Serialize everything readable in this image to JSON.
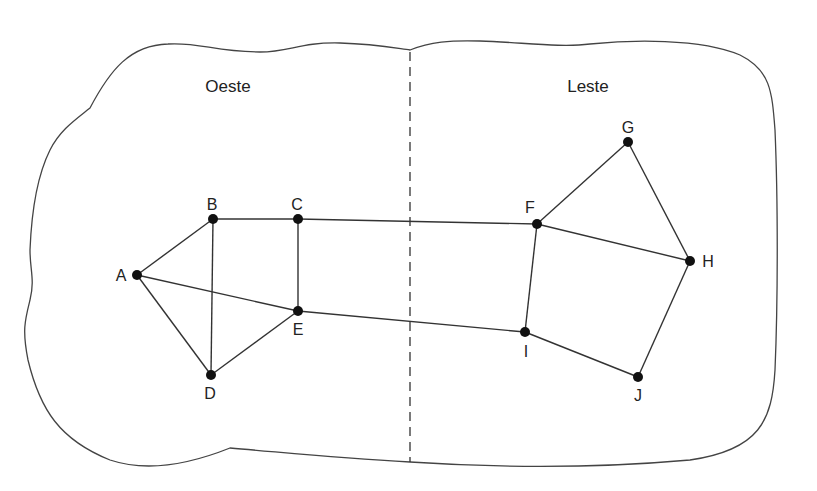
{
  "diagram": {
    "type": "graph",
    "regions": [
      {
        "id": "west",
        "label": "Oeste",
        "x": 228,
        "y": 92
      },
      {
        "id": "east",
        "label": "Leste",
        "x": 588,
        "y": 92
      }
    ],
    "divider": {
      "x": 410,
      "y1": 52,
      "y2": 462,
      "style": "dashed"
    },
    "nodes": [
      {
        "id": "A",
        "label": "A",
        "x": 137,
        "y": 275,
        "lx": 121,
        "ly": 281
      },
      {
        "id": "B",
        "label": "B",
        "x": 213,
        "y": 219,
        "lx": 212,
        "ly": 210
      },
      {
        "id": "C",
        "label": "C",
        "x": 298,
        "y": 219,
        "lx": 297,
        "ly": 210
      },
      {
        "id": "D",
        "label": "D",
        "x": 211,
        "y": 375,
        "lx": 210,
        "ly": 399
      },
      {
        "id": "E",
        "label": "E",
        "x": 298,
        "y": 311,
        "lx": 298,
        "ly": 335
      },
      {
        "id": "F",
        "label": "F",
        "x": 537,
        "y": 224,
        "lx": 530,
        "ly": 213
      },
      {
        "id": "G",
        "label": "G",
        "x": 628,
        "y": 142,
        "lx": 628,
        "ly": 133
      },
      {
        "id": "H",
        "label": "H",
        "x": 690,
        "y": 261,
        "lx": 708,
        "ly": 267
      },
      {
        "id": "I",
        "label": "I",
        "x": 525,
        "y": 332,
        "lx": 526,
        "ly": 357
      },
      {
        "id": "J",
        "label": "J",
        "x": 638,
        "y": 377,
        "lx": 638,
        "ly": 401
      }
    ],
    "edges": [
      [
        "A",
        "B"
      ],
      [
        "A",
        "D"
      ],
      [
        "A",
        "E"
      ],
      [
        "B",
        "C"
      ],
      [
        "B",
        "D"
      ],
      [
        "C",
        "E"
      ],
      [
        "D",
        "E"
      ],
      [
        "C",
        "F"
      ],
      [
        "E",
        "I"
      ],
      [
        "F",
        "G"
      ],
      [
        "F",
        "H"
      ],
      [
        "F",
        "I"
      ],
      [
        "G",
        "H"
      ],
      [
        "H",
        "J"
      ],
      [
        "I",
        "J"
      ]
    ],
    "colors": {
      "stroke": "#333333",
      "node": "#111111",
      "background": "#ffffff"
    }
  }
}
